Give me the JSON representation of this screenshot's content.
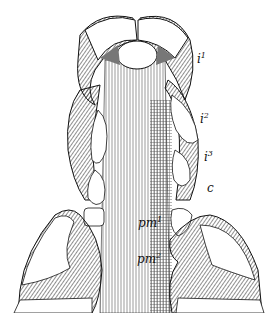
{
  "figure": {
    "labels": [
      {
        "id": "i1",
        "base": "i",
        "sup": "1",
        "x": 197,
        "y": 52
      },
      {
        "id": "i2",
        "base": "i",
        "sup": "2",
        "x": 200,
        "y": 112
      },
      {
        "id": "i3",
        "base": "i",
        "sup": "3",
        "x": 204,
        "y": 150
      },
      {
        "id": "c",
        "base": "c",
        "sup": "",
        "x": 207,
        "y": 182
      },
      {
        "id": "pm1",
        "base": "pm",
        "sup": "1",
        "x": 138,
        "y": 216
      },
      {
        "id": "pm2",
        "base": "pm",
        "sup": "2",
        "x": 137,
        "y": 252
      }
    ]
  },
  "colors": {
    "ink": "#111111",
    "paper": "#ffffff",
    "shade": "#8a8a8a"
  }
}
